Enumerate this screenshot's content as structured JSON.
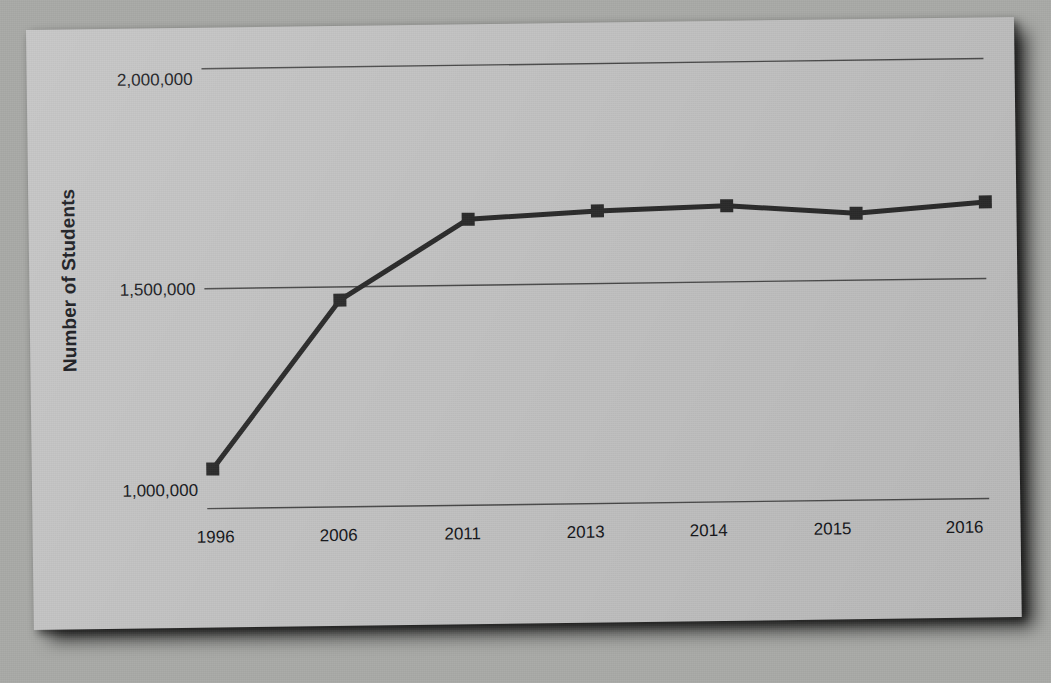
{
  "chart_data": {
    "type": "line",
    "title": "",
    "xlabel": "",
    "ylabel": "Number of Students",
    "categories": [
      "1996",
      "2006",
      "2011",
      "2013",
      "2014",
      "2015",
      "2016"
    ],
    "values": [
      1090000,
      1470000,
      1650000,
      1665000,
      1673000,
      1652000,
      1674000
    ],
    "series": [
      {
        "name": "Number of Students",
        "values": [
          1090000,
          1470000,
          1650000,
          1665000,
          1673000,
          1652000,
          1674000
        ]
      }
    ],
    "ylim": [
      1000000,
      2000000
    ],
    "y_ticks": [
      1000000,
      1500000,
      2000000
    ],
    "y_tick_labels": [
      "1,000,000",
      "1,500,000",
      "2,000,000"
    ],
    "grid": "horizontal",
    "legend": "none",
    "marker": "square",
    "line_color": "#2b2b2b",
    "marker_color": "#2b2b2b",
    "grid_color": "#4a4a4a",
    "plot_background": "#c2c2c2",
    "page_background": "#a9aaa7"
  },
  "axes": {
    "y_title": "Number of Students",
    "y_labels": [
      "2,000,000",
      "1,500,000",
      "1,000,000"
    ],
    "x_labels": [
      "1996",
      "2006",
      "2011",
      "2013",
      "2014",
      "2015",
      "2016"
    ]
  }
}
